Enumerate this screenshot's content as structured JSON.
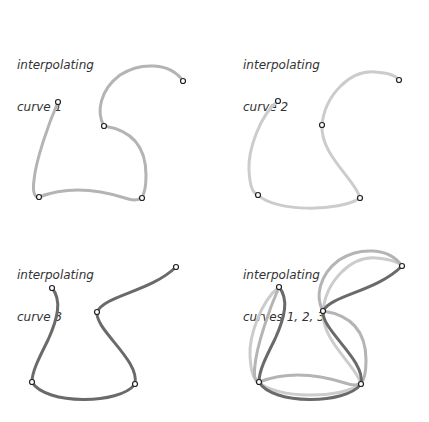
{
  "panels": [
    {
      "title_line1": "interpolating",
      "title_line2": "curve 1"
    },
    {
      "title_line1": "interpolating",
      "title_line2": "curve 2"
    },
    {
      "title_line1": "interpolating",
      "title_line2": "curve 3"
    },
    {
      "title_line1": "interpolating",
      "title_line2": "curves 1, 2, 3"
    }
  ],
  "colors": {
    "curve1": "#b4b4b4",
    "curve2": "#cccccc",
    "curve3": "#6a6a6a",
    "point_stroke": "#222222"
  }
}
